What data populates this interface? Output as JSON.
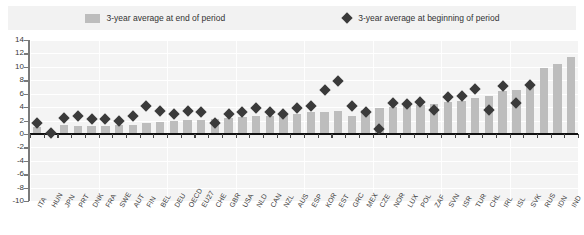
{
  "legend": {
    "bar_label": "3-year average at end of period",
    "diamond_label": "3-year average at beginning of period",
    "bar_color": "#bdbdbd",
    "diamond_color": "#3a3a3a",
    "swatch_icon": "square-swatch-icon",
    "marker_icon": "diamond-marker-icon"
  },
  "chart_data": {
    "type": "bar",
    "title": "",
    "xlabel": "",
    "ylabel": "",
    "ylim": [
      -10,
      14
    ],
    "ytick_step": 2,
    "yticks": [
      14,
      12,
      10,
      8,
      6,
      4,
      2,
      0,
      -2,
      -4,
      -6,
      -8,
      -10
    ],
    "grid": true,
    "legend_position": "top",
    "categories": [
      "ITA",
      "HUN",
      "JPN",
      "PRT",
      "DNK",
      "FRA",
      "SWE",
      "AUT",
      "FIN",
      "BEL",
      "DEU",
      "OECD",
      "EU27",
      "CHE",
      "GBR",
      "USA",
      "NLD",
      "CAN",
      "NZL",
      "AUS",
      "ESP",
      "KOR",
      "EST",
      "GRC",
      "MEX",
      "CZE",
      "NOR",
      "LUX",
      "POL",
      "ZAF",
      "SVN",
      "ISR",
      "TUR",
      "CHL",
      "IRL",
      "ISL",
      "SVK",
      "RUS",
      "IDN",
      "IND"
    ],
    "series": [
      {
        "name": "3-year average at end of period",
        "marker": "bar",
        "values": [
          1.0,
          0.2,
          1.3,
          1.2,
          1.2,
          1.2,
          1.3,
          1.3,
          1.6,
          1.8,
          1.9,
          2.1,
          2.1,
          2.2,
          2.4,
          2.5,
          2.6,
          2.7,
          2.9,
          3.0,
          3.2,
          3.3,
          3.4,
          2.6,
          3.6,
          3.8,
          4.0,
          4.1,
          4.3,
          4.5,
          4.7,
          4.9,
          5.3,
          5.6,
          6.4,
          6.6,
          7.3,
          9.9,
          10.4,
          11.4
        ]
      },
      {
        "name": "3-year average at beginning of period",
        "marker": "diamond",
        "values": [
          1.6,
          0.2,
          2.4,
          2.7,
          2.2,
          2.2,
          2.0,
          2.7,
          4.2,
          3.4,
          3.0,
          3.4,
          3.2,
          1.7,
          3.0,
          3.2,
          3.9,
          3.3,
          3.0,
          3.8,
          4.1,
          6.5,
          7.9,
          4.1,
          3.2,
          0.8,
          4.6,
          4.4,
          4.7,
          3.6,
          5.5,
          5.6,
          6.7,
          3.6,
          7.2,
          4.6,
          7.3,
          null,
          null,
          null
        ]
      }
    ]
  }
}
